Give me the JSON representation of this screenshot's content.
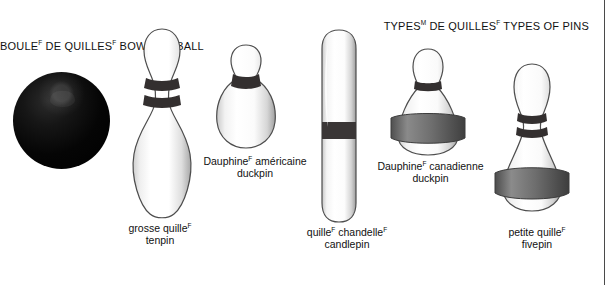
{
  "titles": {
    "ball": {
      "fr": "BOULE",
      "fr_sup": "F",
      "fr_rest": " DE QUILLES",
      "fr_sup2": "F",
      "en": "BOWLING BALL"
    },
    "types": {
      "fr": "TYPES",
      "fr_sup": "M",
      "fr_rest": " DE QUILLES",
      "fr_sup2": "F",
      "en": "TYPES OF PINS"
    }
  },
  "captions": [
    {
      "id": "tenpin",
      "fr": "grosse quille",
      "fr_sup": "F",
      "fr_rest": "",
      "en": "tenpin"
    },
    {
      "id": "duckpin-us",
      "fr": "Dauphine",
      "fr_sup": "F",
      "fr_rest": " américaine",
      "en": "duckpin"
    },
    {
      "id": "candlepin",
      "fr": "quille",
      "fr_sup": "F",
      "fr_rest": " chandelle",
      "fr_sup2": "F",
      "en": "candlepin"
    },
    {
      "id": "duckpin-canadian",
      "fr": "Dauphine",
      "fr_sup": "F",
      "fr_rest": " canadienne",
      "en": "duckpin"
    },
    {
      "id": "fivepin",
      "fr": "petite quille",
      "fr_sup": "F",
      "fr_rest": "",
      "en": "fivepin"
    }
  ],
  "colors": {
    "ball": "#000000",
    "pin_body": "#ffffff",
    "pin_outline": "#4d4d4d",
    "neck_band": "#332f2f",
    "rubber_band": "#6b6b6b",
    "text": "#111111",
    "page_rule": "#4a4a4a",
    "background": "#ffffff"
  }
}
